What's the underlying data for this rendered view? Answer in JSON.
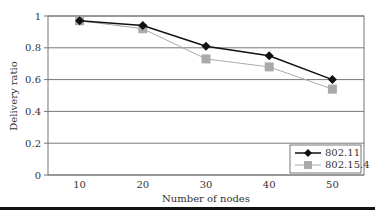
{
  "chart_data": {
    "type": "line",
    "title": "",
    "xlabel": "Number of nodes",
    "ylabel": "Delivery ratio",
    "categories": [
      "10",
      "20",
      "30",
      "40",
      "50"
    ],
    "x": [
      10,
      20,
      30,
      40,
      50
    ],
    "yticks": [
      "0",
      "0.2",
      "0.4",
      "0.6",
      "0.8",
      "1"
    ],
    "ylim": [
      0,
      1
    ],
    "grid": "horizontal",
    "legend_position": "lower right, inside plot",
    "series": [
      {
        "name": "802.11",
        "marker": "diamond",
        "color": "#111111",
        "values": [
          0.97,
          0.94,
          0.81,
          0.75,
          0.6
        ]
      },
      {
        "name": "802.15.4",
        "marker": "square",
        "color": "#aaaaaa",
        "values": [
          0.97,
          0.92,
          0.73,
          0.68,
          0.54
        ]
      }
    ]
  },
  "legend": {
    "items": [
      {
        "label": "802.11"
      },
      {
        "label": "802.15.4"
      }
    ]
  }
}
